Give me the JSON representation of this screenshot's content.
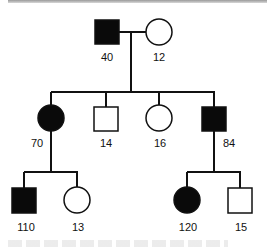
{
  "diagram": {
    "type": "pedigree",
    "colors": {
      "affected": "#0a0a0a",
      "unaffected": "#ffffff",
      "line": "#111111"
    },
    "generations": [
      {
        "id": "I",
        "members": [
          {
            "id": "40",
            "label": "40",
            "sex": "male",
            "affected": true
          },
          {
            "id": "12",
            "label": "12",
            "sex": "female",
            "affected": false
          }
        ]
      },
      {
        "id": "II",
        "members": [
          {
            "id": "70",
            "label": "70",
            "sex": "female",
            "affected": true
          },
          {
            "id": "14",
            "label": "14",
            "sex": "male",
            "affected": false
          },
          {
            "id": "16",
            "label": "16",
            "sex": "female",
            "affected": false
          },
          {
            "id": "84",
            "label": "84",
            "sex": "male",
            "affected": true
          }
        ]
      },
      {
        "id": "III",
        "members": [
          {
            "id": "110",
            "label": "110",
            "sex": "male",
            "affected": true,
            "parent": "70"
          },
          {
            "id": "13",
            "label": "13",
            "sex": "female",
            "affected": false,
            "parent": "70"
          },
          {
            "id": "120",
            "label": "120",
            "sex": "female",
            "affected": true,
            "parent": "84"
          },
          {
            "id": "15",
            "label": "15",
            "sex": "male",
            "affected": false,
            "parent": "84"
          }
        ]
      }
    ]
  },
  "labels": {
    "g1_male": "40",
    "g1_female": "12",
    "g2_1": "70",
    "g2_2": "14",
    "g2_3": "16",
    "g2_4": "84",
    "g3_1": "110",
    "g3_2": "13",
    "g3_3": "120",
    "g3_4": "15"
  }
}
